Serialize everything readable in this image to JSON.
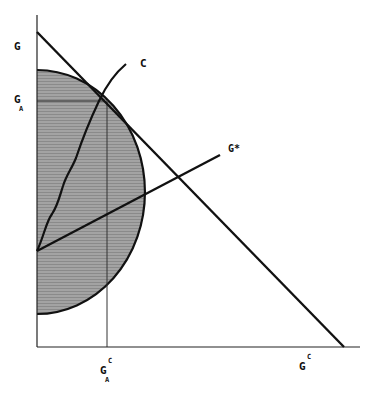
{
  "diagram": {
    "colors": {
      "line": "#111111",
      "shade": "#9a9a9a",
      "background": "#ffffff"
    },
    "labels": {
      "y_top": "G",
      "y_mid_main": "G",
      "y_mid_sub": "A",
      "curve_c": "C",
      "ray_gstar": "G*",
      "x_left_main": "G",
      "x_left_sup": "C",
      "x_left_sub": "A",
      "x_right_main": "G",
      "x_right_sup": "C"
    },
    "elements": {
      "axes": "Vertical axis G and horizontal axis G^C",
      "budget_line": "Straight line from vertical axis intercept to horizontal axis intercept",
      "shaded_region": "Half-ellipse shaded region bounded by vertical axis",
      "curve_c": "Curve C rising from vertical axis through tangency point",
      "ray_gstar": "Ray G* from vertical axis",
      "tangency_guides": "Horizontal guide at G_A and vertical guide at G_A^C"
    }
  }
}
